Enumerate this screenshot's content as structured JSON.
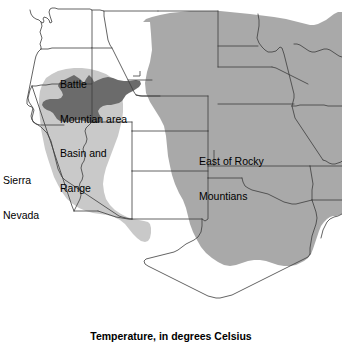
{
  "figure": {
    "caption": "Temperature, in degrees Celsius",
    "type": "thematic-region-map",
    "region": "Western and Central United States"
  },
  "map": {
    "labels": [
      {
        "id": "battle-mountain",
        "line1": "Battle",
        "line2": "Mountian area"
      },
      {
        "id": "basin-range",
        "line1": "Basin and",
        "line2": "Range"
      },
      {
        "id": "sierra-nevada",
        "line1": "Sierra",
        "line2": "Nevada"
      },
      {
        "id": "east-rocky",
        "line1": "East of Rocky",
        "line2": "Mountians"
      }
    ],
    "regions": [
      {
        "name": "Battle Mountian area",
        "shade": "dark-gray",
        "color": "#6b6b6b"
      },
      {
        "name": "Basin and Range",
        "shade": "light-gray",
        "color": "#c9c9c9"
      },
      {
        "name": "East of Rocky Mountians",
        "shade": "medium-gray",
        "color": "#a9a9a9"
      },
      {
        "name": "Sierra Nevada",
        "shade": "light-gray",
        "color": "#c9c9c9"
      }
    ],
    "colors": {
      "background": "#ffffff",
      "outline": "#3c3c3c",
      "dark_gray": "#6b6b6b",
      "medium_gray": "#a9a9a9",
      "light_gray": "#c9c9c9"
    }
  }
}
